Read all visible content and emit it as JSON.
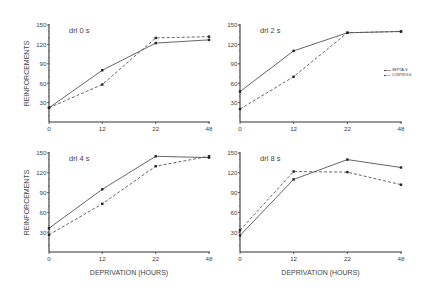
{
  "chart_data": [
    {
      "type": "line",
      "title": "drl 0 s",
      "xlabel": "",
      "ylabel": "REINFORCEMENTS",
      "x": [
        "0",
        "12",
        "22",
        "48"
      ],
      "yticks": [
        30,
        60,
        90,
        120,
        150
      ],
      "ylim": [
        0,
        150
      ],
      "grid": false,
      "series": [
        {
          "name": "SEPTALS",
          "style": "solid",
          "values": [
            22,
            80,
            122,
            127
          ]
        },
        {
          "name": "CONTROLS",
          "style": "dashed",
          "values": [
            22,
            58,
            130,
            132
          ]
        }
      ]
    },
    {
      "type": "line",
      "title": "drl 2 s",
      "xlabel": "",
      "ylabel": "",
      "x": [
        "0",
        "12",
        "22",
        "48"
      ],
      "yticks": [
        30,
        60,
        90,
        120,
        150
      ],
      "ylim": [
        0,
        150
      ],
      "grid": false,
      "legend_position": "right",
      "series": [
        {
          "name": "SEPTALS",
          "style": "solid",
          "values": [
            47,
            110,
            138,
            140
          ]
        },
        {
          "name": "CONTROLS",
          "style": "dashed",
          "values": [
            20,
            70,
            138,
            140
          ]
        }
      ]
    },
    {
      "type": "line",
      "title": "drl 4 s",
      "xlabel": "DEPRIVATION (HOURS)",
      "ylabel": "REINFORCEMENTS",
      "x": [
        "0",
        "12",
        "22",
        "48"
      ],
      "yticks": [
        30,
        60,
        90,
        120,
        150
      ],
      "ylim": [
        0,
        150
      ],
      "grid": false,
      "series": [
        {
          "name": "SEPTALS",
          "style": "solid",
          "values": [
            36,
            95,
            145,
            143
          ]
        },
        {
          "name": "CONTROLS",
          "style": "dashed",
          "values": [
            26,
            73,
            130,
            145
          ]
        }
      ]
    },
    {
      "type": "line",
      "title": "drl 8 s",
      "xlabel": "DEPRIVATION (HOURS)",
      "ylabel": "",
      "x": [
        "0",
        "12",
        "22",
        "48"
      ],
      "yticks": [
        30,
        60,
        90,
        120,
        150
      ],
      "ylim": [
        0,
        150
      ],
      "grid": false,
      "series": [
        {
          "name": "SEPTALS",
          "style": "solid",
          "values": [
            25,
            110,
            140,
            128
          ]
        },
        {
          "name": "CONTROLS",
          "style": "dashed",
          "values": [
            33,
            122,
            121,
            102
          ]
        }
      ]
    }
  ],
  "legend": {
    "items": [
      {
        "label": "SEPTALS",
        "style": "solid"
      },
      {
        "label": "CONTROLS",
        "style": "dashed"
      }
    ]
  },
  "colors": {
    "line": "#555555",
    "axis": "#333333",
    "text": "#444444"
  }
}
